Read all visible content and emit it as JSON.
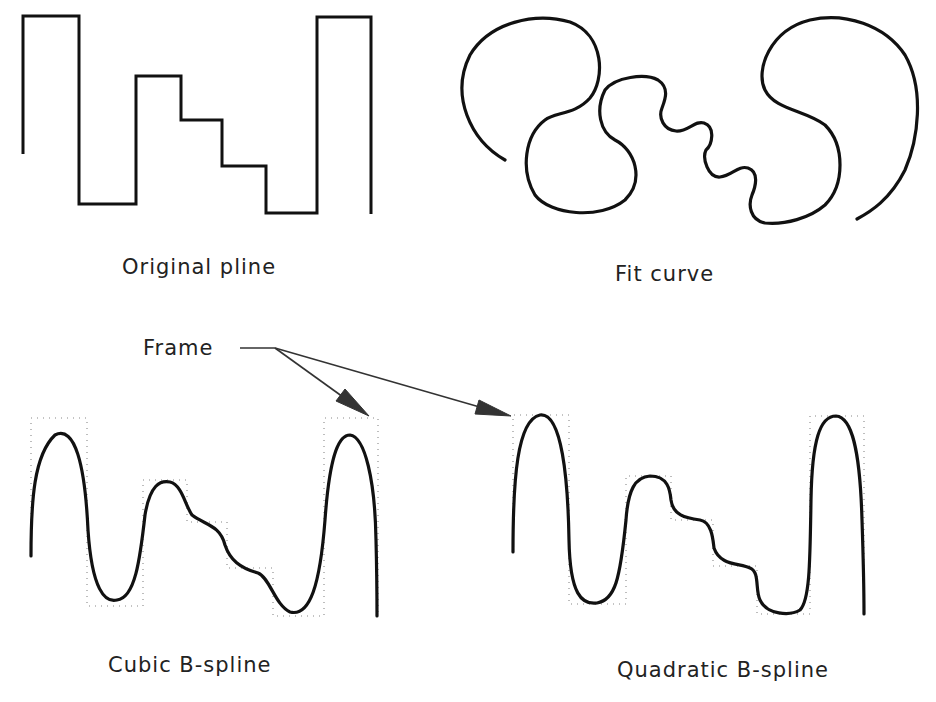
{
  "diagram": {
    "panels": [
      {
        "id": "original",
        "label": "Original pline"
      },
      {
        "id": "fit",
        "label": "Fit curve"
      },
      {
        "id": "cubic",
        "label": "Cubic B-spline"
      },
      {
        "id": "quadratic",
        "label": "Quadratic B-spline"
      }
    ],
    "callout": {
      "label": "Frame",
      "targets": [
        "cubic",
        "quadratic"
      ]
    }
  }
}
